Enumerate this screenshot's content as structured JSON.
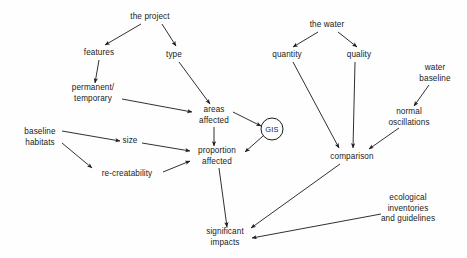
{
  "diagram": {
    "background_color": "#fefefe",
    "line_color": "#1a1a1a",
    "text_color": "#1a1a1a",
    "nodes": [
      {
        "id": "the-project",
        "label": "the project",
        "x": 150,
        "y": 17,
        "shape": "text"
      },
      {
        "id": "features",
        "label": "features",
        "x": 99,
        "y": 53,
        "shape": "text"
      },
      {
        "id": "type",
        "label": "type",
        "x": 174,
        "y": 55,
        "shape": "text"
      },
      {
        "id": "permanent-temporary",
        "label": "permanent/\ntemporary",
        "x": 93,
        "y": 93,
        "shape": "text"
      },
      {
        "id": "areas-affected",
        "label": "areas\naffected",
        "x": 214,
        "y": 115,
        "shape": "text"
      },
      {
        "id": "gis",
        "label": "GIS",
        "x": 272,
        "y": 129,
        "shape": "circle"
      },
      {
        "id": "baseline-habitats",
        "label": "baseline\nhabitats",
        "x": 40,
        "y": 137,
        "shape": "text"
      },
      {
        "id": "size",
        "label": "size",
        "x": 130,
        "y": 141,
        "shape": "text"
      },
      {
        "id": "re-creatability",
        "label": "re-creatability",
        "x": 127,
        "y": 174,
        "shape": "text"
      },
      {
        "id": "proportion-affected",
        "label": "proportion\naffected",
        "x": 217,
        "y": 156,
        "shape": "text"
      },
      {
        "id": "the-water",
        "label": "the water",
        "x": 327,
        "y": 25,
        "shape": "text"
      },
      {
        "id": "quantity",
        "label": "quantity",
        "x": 287,
        "y": 55,
        "shape": "text"
      },
      {
        "id": "quality",
        "label": "quality",
        "x": 359,
        "y": 55,
        "shape": "text"
      },
      {
        "id": "water-baseline",
        "label": "water\nbaseline",
        "x": 435,
        "y": 73,
        "shape": "text"
      },
      {
        "id": "normal-oscillations",
        "label": "normal\noscillations",
        "x": 409,
        "y": 117,
        "shape": "text"
      },
      {
        "id": "comparison",
        "label": "comparison",
        "x": 352,
        "y": 157,
        "shape": "text"
      },
      {
        "id": "ecological-inventories",
        "label": "ecological\ninventories\nand guidelines",
        "x": 408,
        "y": 209,
        "shape": "text"
      },
      {
        "id": "significant-impacts",
        "label": "significant\nimpacts",
        "x": 225,
        "y": 237,
        "shape": "text"
      }
    ],
    "edges": [
      {
        "id": "project-to-features",
        "from": "the-project",
        "to": "features",
        "x1": 141,
        "y1": 24,
        "x2": 105,
        "y2": 45
      },
      {
        "id": "project-to-type",
        "from": "the-project",
        "to": "type",
        "x1": 162,
        "y1": 24,
        "x2": 176,
        "y2": 46
      },
      {
        "id": "features-to-permanent",
        "from": "features",
        "to": "permanent-temporary",
        "x1": 99,
        "y1": 60,
        "x2": 95,
        "y2": 83
      },
      {
        "id": "type-to-areas",
        "from": "type",
        "to": "areas-affected",
        "x1": 179,
        "y1": 62,
        "x2": 210,
        "y2": 104
      },
      {
        "id": "permanent-to-areas",
        "from": "permanent-temporary",
        "to": "areas-affected",
        "x1": 122,
        "y1": 99,
        "x2": 192,
        "y2": 112
      },
      {
        "id": "areas-to-gis",
        "from": "areas-affected",
        "to": "gis",
        "x1": 233,
        "y1": 112,
        "x2": 261,
        "y2": 126
      },
      {
        "id": "areas-to-proportion",
        "from": "areas-affected",
        "to": "proportion-affected",
        "x1": 214,
        "y1": 127,
        "x2": 214,
        "y2": 146
      },
      {
        "id": "gis-to-proportion",
        "from": "gis",
        "to": "proportion-affected",
        "x1": 263,
        "y1": 136,
        "x2": 245,
        "y2": 152
      },
      {
        "id": "baseline-to-size",
        "from": "baseline-habitats",
        "to": "size",
        "x1": 62,
        "y1": 131,
        "x2": 120,
        "y2": 141
      },
      {
        "id": "baseline-to-recreatability",
        "from": "baseline-habitats",
        "to": "re-creatability",
        "x1": 62,
        "y1": 143,
        "x2": 92,
        "y2": 168
      },
      {
        "id": "size-to-proportion",
        "from": "size",
        "to": "proportion-affected",
        "x1": 142,
        "y1": 143,
        "x2": 190,
        "y2": 151
      },
      {
        "id": "recreatability-to-proportion",
        "from": "re-creatability",
        "to": "proportion-affected",
        "x1": 163,
        "y1": 172,
        "x2": 190,
        "y2": 161
      },
      {
        "id": "water-to-quantity",
        "from": "the-water",
        "to": "quantity",
        "x1": 318,
        "y1": 32,
        "x2": 293,
        "y2": 47
      },
      {
        "id": "water-to-quality",
        "from": "the-water",
        "to": "quality",
        "x1": 338,
        "y1": 32,
        "x2": 357,
        "y2": 47
      },
      {
        "id": "quantity-to-comparison",
        "from": "quantity",
        "to": "comparison",
        "x1": 293,
        "y1": 62,
        "x2": 339,
        "y2": 148
      },
      {
        "id": "quality-to-comparison",
        "from": "quality",
        "to": "comparison",
        "x1": 355,
        "y1": 62,
        "x2": 353,
        "y2": 148
      },
      {
        "id": "waterbaseline-to-oscillations",
        "from": "water-baseline",
        "to": "normal-oscillations",
        "x1": 429,
        "y1": 85,
        "x2": 414,
        "y2": 106
      },
      {
        "id": "oscillations-to-comparison",
        "from": "normal-oscillations",
        "to": "comparison",
        "x1": 399,
        "y1": 128,
        "x2": 369,
        "y2": 149
      },
      {
        "id": "proportion-to-impacts",
        "from": "proportion-affected",
        "to": "significant-impacts",
        "x1": 219,
        "y1": 168,
        "x2": 227,
        "y2": 227
      },
      {
        "id": "comparison-to-impacts",
        "from": "comparison",
        "to": "significant-impacts",
        "x1": 340,
        "y1": 164,
        "x2": 251,
        "y2": 228
      },
      {
        "id": "ecological-to-impacts",
        "from": "ecological-inventories",
        "to": "significant-impacts",
        "x1": 381,
        "y1": 214,
        "x2": 252,
        "y2": 238
      }
    ]
  }
}
